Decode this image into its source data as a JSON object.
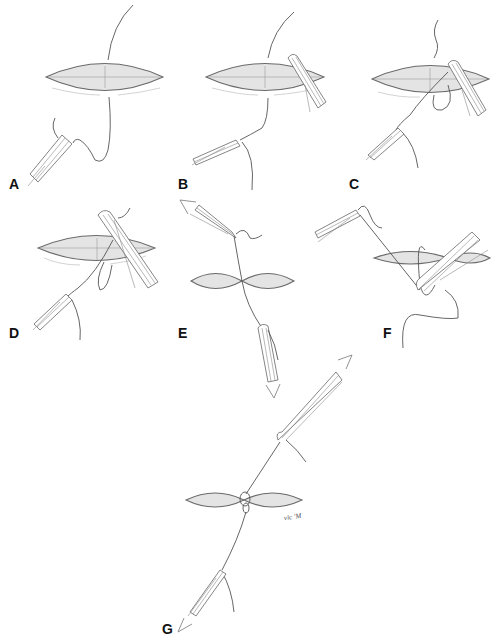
{
  "figure": {
    "type": "surgical knot-tying sequence illustration",
    "panels": [
      {
        "id": "A",
        "label": "A",
        "description": "Needle passed through wound; needle holder grasping suture end"
      },
      {
        "id": "B",
        "label": "B",
        "description": "Forceps placed at wound edge; suture drawn through"
      },
      {
        "id": "C",
        "label": "C",
        "description": "Suture looped around instrument"
      },
      {
        "id": "D",
        "label": "D",
        "description": "Instrument tie loop tightened around jaws"
      },
      {
        "id": "E",
        "label": "E",
        "description": "Ends pulled in opposite directions, first throw laid down"
      },
      {
        "id": "F",
        "label": "F",
        "description": "Second loop formed around instrument"
      },
      {
        "id": "G",
        "label": "G",
        "description": "Knot secured, ends pulled in opposite directions"
      }
    ],
    "signature": "vic 'M"
  },
  "colors": {
    "background": "#ffffff",
    "line": "#555555",
    "wound_fill": "#e4e4e4",
    "label": "#111111"
  }
}
